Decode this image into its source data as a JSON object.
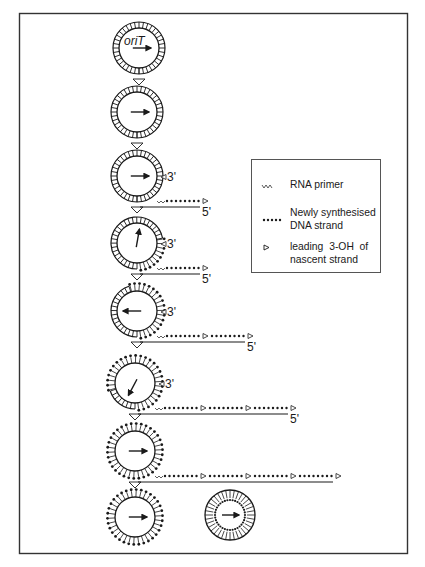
{
  "figure": {
    "type": "diagram",
    "origin_label": "oriT",
    "end_labels": {
      "three_prime": "3'",
      "five_prime": "5'"
    },
    "colors": {
      "ink": "#1a1a1a",
      "frame": "#333333",
      "background": "#ffffff"
    }
  },
  "legend": {
    "items": [
      {
        "icon": "rna-primer-icon",
        "label": "RNA primer"
      },
      {
        "icon": "dotted-strand-icon",
        "label_line1": "Newly synthesised",
        "label_line2": "DNA strand"
      },
      {
        "icon": "open-triangle-icon",
        "label_line1": "leading  3-OH  of",
        "label_line2": "nascent strand"
      }
    ]
  },
  "steps": [
    {
      "index": 1,
      "arrow_dir": "right",
      "label": "oriT",
      "synth_fraction": 0,
      "tail_segments": 0
    },
    {
      "index": 2,
      "arrow_dir": "right",
      "synth_fraction": 0,
      "tail_segments": 0
    },
    {
      "index": 3,
      "arrow_dir": "right",
      "three_prime": "3'",
      "five_prime": "5'",
      "tail_segments": 1
    },
    {
      "index": 4,
      "arrow_dir": "up",
      "three_prime": "3'",
      "five_prime": "5'",
      "tail_segments": 1
    },
    {
      "index": 5,
      "arrow_dir": "left",
      "three_prime": "3'",
      "five_prime": "5'",
      "tail_segments": 2
    },
    {
      "index": 6,
      "arrow_dir": "down-left",
      "three_prime": "3'",
      "five_prime": "5'",
      "tail_segments": 3
    },
    {
      "index": 7,
      "arrow_dir": "right",
      "tail_segments": 4
    },
    {
      "index": 8,
      "arrow_dir": "right",
      "tail_segments": 0
    },
    {
      "index": 9,
      "arrow_dir": "right",
      "description": "recircularised complementary strand"
    }
  ]
}
